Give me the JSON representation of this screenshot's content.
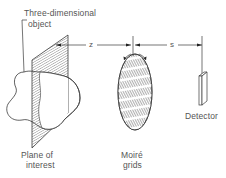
{
  "diagram": {
    "labels": {
      "object_line1": "Three-dimensional",
      "object_line2": "object",
      "plane_line1": "Plane of",
      "plane_line2": "interest",
      "grids_line1": "Moiré",
      "grids_line2": "grids",
      "detector": "Detector"
    },
    "dimensions": {
      "z": "z",
      "s": "s"
    },
    "colors": {
      "line": "#3a3a3a",
      "text": "#555555",
      "background": "#ffffff"
    }
  }
}
